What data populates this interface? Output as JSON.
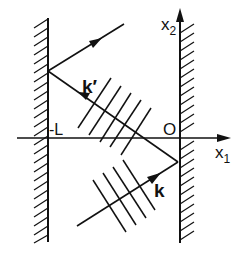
{
  "diagram": {
    "labels": {
      "x1": "x",
      "x1_sub": "1",
      "x2": "x",
      "x2_sub": "2",
      "origin": "O",
      "minus_L": "-L",
      "k": "k",
      "k_prime": "k′"
    },
    "colors": {
      "ink": "#111111",
      "background": "#ffffff"
    },
    "elements": {
      "left_wall": {
        "x": 48,
        "y_top": 18,
        "y_bottom": 242
      },
      "right_wall": {
        "x": 180,
        "y_top": 10,
        "y_bottom": 243
      },
      "x1_axis": {
        "y": 138,
        "x_start": 17,
        "x_end": 229
      },
      "incident_ray_k": {
        "from": [
          77,
          226
        ],
        "to": [
          178,
          162
        ]
      },
      "reflected_ray_k_prime": {
        "from": [
          178,
          162
        ],
        "to": [
          48,
          71
        ]
      },
      "second_reflection": {
        "from": [
          48,
          71
        ],
        "to": [
          124,
          24
        ]
      }
    }
  }
}
